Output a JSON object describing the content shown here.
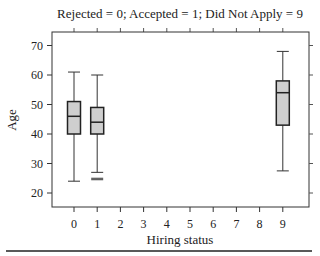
{
  "chart_data": {
    "type": "boxplot",
    "title": "Rejected = 0;  Accepted = 1;  Did Not Apply = 9",
    "xlabel": "Hiring status",
    "ylabel": "Age",
    "x_ticks": [
      "0",
      "1",
      "2",
      "3",
      "4",
      "5",
      "6",
      "7",
      "8",
      "9"
    ],
    "y_ticks": [
      20,
      30,
      40,
      50,
      60,
      70
    ],
    "ylim": [
      16,
      74.5
    ],
    "xlim": [
      -1,
      10
    ],
    "grid": false,
    "legend": null,
    "boxes": [
      {
        "category": "0",
        "label": "Rejected",
        "whisker_low": 24,
        "q1": 40,
        "median": 46,
        "q3": 51,
        "whisker_high": 61,
        "outliers": []
      },
      {
        "category": "1",
        "label": "Accepted",
        "whisker_low": 27,
        "q1": 40,
        "median": 44,
        "q3": 49,
        "whisker_high": 60,
        "outliers": [
          25,
          24.5
        ]
      },
      {
        "category": "9",
        "label": "Did Not Apply",
        "whisker_low": 27.5,
        "q1": 43,
        "median": 54,
        "q3": 58,
        "whisker_high": 68,
        "outliers": []
      }
    ],
    "box_fill": "#cfcfcf",
    "line_color": "#333333"
  }
}
